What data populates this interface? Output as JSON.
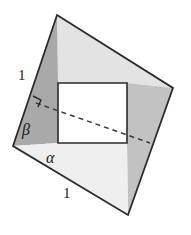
{
  "figure": {
    "background_color": "#ffffff",
    "outline_color": "#2b2b2b",
    "labels": {
      "side_left_length": "1",
      "side_bottom_length": "1",
      "angle_beta": "β",
      "angle_alpha": "α"
    },
    "colors": {
      "dark_gray": "#a9a9a9",
      "mid_gray": "#c9c9c9",
      "light_gray": "#e3e3e3",
      "pale_gray": "#efefef",
      "white": "#ffffff",
      "stroke": "#2b2b2b",
      "dash": "#3a3a3a"
    },
    "vertices": {
      "top": "57,15",
      "right": "173,88",
      "bottom": "128,215",
      "left": "13,146"
    },
    "inner_rectangle": {
      "left": "58",
      "top": "83",
      "right": "127",
      "bottom": "143"
    },
    "dashed_line": {
      "from": "36,103",
      "to": "150,143"
    },
    "right_angle_marker": "present"
  }
}
